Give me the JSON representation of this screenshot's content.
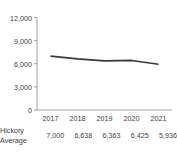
{
  "chart_data": {
    "type": "line",
    "title": "",
    "xlabel": "",
    "ylabel": "",
    "categories": [
      "2017",
      "2018",
      "2019",
      "2020",
      "2021"
    ],
    "series": [
      {
        "name": "Hickory Average",
        "values": [
          7000,
          6638,
          6363,
          6425,
          5936
        ],
        "color": "#3a3a3a"
      }
    ],
    "ylim": [
      0,
      12000
    ],
    "yticks": [
      0,
      3000,
      6000,
      9000,
      12000
    ],
    "ytick_labels": [
      "0",
      "3,000",
      "6,000",
      "9,000",
      "12,000"
    ],
    "grid": false,
    "legend": "none"
  },
  "axis": {
    "y_labels": [
      "12,000",
      "9,000",
      "6,000",
      "3,000",
      "0"
    ],
    "x_labels": [
      "2017",
      "2018",
      "2019",
      "2020",
      "2021"
    ],
    "axis_color": "#8a8a8a"
  },
  "table": {
    "row_label_line1": "Hickory",
    "row_label_line2": "Average",
    "values": [
      "7,000",
      "6,638",
      "6,363",
      "6,425",
      "5,936"
    ]
  }
}
